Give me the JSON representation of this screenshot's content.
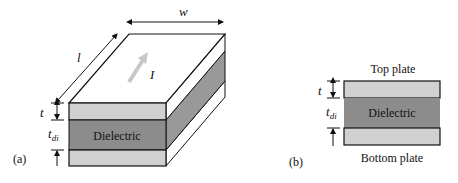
{
  "figure_a": {
    "label": "(a)",
    "dielectric_label": "Dielectric",
    "dim_width": "w",
    "dim_length": "l",
    "current_label": "I",
    "dim_thickness": "t",
    "dim_dielectric_thickness_base": "t",
    "dim_dielectric_thickness_sub": "di"
  },
  "figure_b": {
    "label": "(b)",
    "top_plate_label": "Top plate",
    "bottom_plate_label": "Bottom plate",
    "dielectric_label": "Dielectric",
    "dim_thickness": "t",
    "dim_dielectric_thickness_base": "t",
    "dim_dielectric_thickness_sub": "di"
  },
  "colors": {
    "plate": "#d0d0d0",
    "dielectric": "#8c8c8c",
    "side_plate": "#ffffff",
    "side_dielectric": "#999999",
    "current_arrow": "#c8c8c8",
    "stroke": "#111111"
  }
}
